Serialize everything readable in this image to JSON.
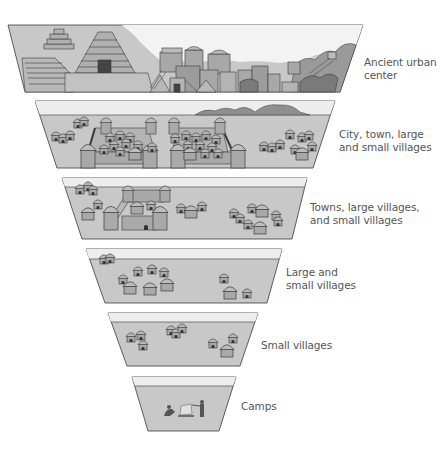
{
  "diagram": {
    "type": "stacked-tiers",
    "colors": {
      "ground": "#c8c8c8",
      "sky": "#ededed",
      "outline": "#3a3a3a",
      "building_fill": "#a9a9a9",
      "building_dark": "#7a7a7a",
      "hill": "#8f8f8f",
      "label_text": "#555555"
    },
    "tiers": [
      {
        "label_line1": "Ancient urban",
        "label_line2": "center",
        "content": "pyramids, temples and dense stone buildings"
      },
      {
        "label_line1": "City, town, large",
        "label_line2": "and small villages",
        "content": "two walled cities with huts and outlying villages"
      },
      {
        "label_line1": "Towns, large villages,",
        "label_line2": "and small villages",
        "content": "one walled town with villages"
      },
      {
        "label_line1": "Large and",
        "label_line2": "small villages",
        "content": "clusters of huts"
      },
      {
        "label_line1": "Small villages",
        "label_line2": "",
        "content": "a few small hut clusters"
      },
      {
        "label_line1": "Camps",
        "label_line2": "",
        "content": "people around a campfire"
      }
    ]
  }
}
